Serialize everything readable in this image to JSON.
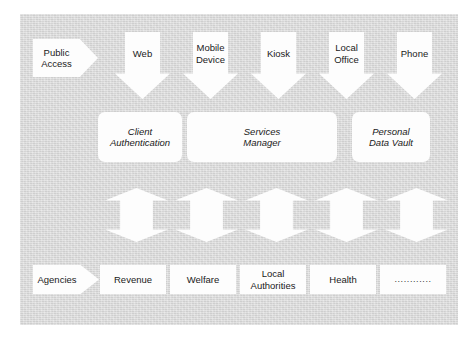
{
  "diagram": {
    "background_color": "#d9d9d9",
    "shape_fill_color": "#fdfdfd",
    "text_color": "#1a1a1a",
    "channel_row": {
      "entry_label_line1": "Public",
      "entry_label_line2": "Access",
      "channels": [
        {
          "line1": "Web",
          "line2": ""
        },
        {
          "line1": "Mobile",
          "line2": "Device"
        },
        {
          "line1": "Kiosk",
          "line2": ""
        },
        {
          "line1": "Local",
          "line2": "Office"
        },
        {
          "line1": "Phone",
          "line2": ""
        }
      ]
    },
    "service_row": {
      "components": [
        {
          "line1": "Client",
          "line2": "Authentication"
        },
        {
          "line1": "Services",
          "line2": "Manager"
        },
        {
          "line1": "Personal",
          "line2": "Data Vault"
        }
      ]
    },
    "connector_row": {
      "count": 5,
      "type": "bidirectional-vertical-arrow"
    },
    "agency_row": {
      "entry_label": "Agencies",
      "agencies": [
        {
          "line1": "Revenue",
          "line2": ""
        },
        {
          "line1": "Welfare",
          "line2": ""
        },
        {
          "line1": "Local",
          "line2": "Authorities"
        },
        {
          "line1": "Health",
          "line2": ""
        },
        {
          "line1": "............",
          "line2": ""
        }
      ]
    }
  }
}
